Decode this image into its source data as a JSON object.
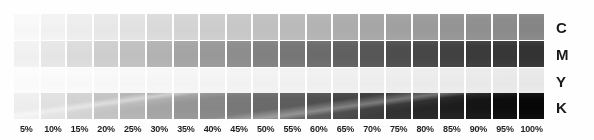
{
  "chart_data": {
    "type": "heatmap",
    "xlabel": "",
    "ylabel": "",
    "grid": false,
    "legend_position": "right",
    "categories": [
      "5%",
      "10%",
      "15%",
      "20%",
      "25%",
      "30%",
      "35%",
      "40%",
      "45%",
      "50%",
      "55%",
      "60%",
      "65%",
      "70%",
      "75%",
      "80%",
      "85%",
      "90%",
      "95%",
      "100%"
    ],
    "tick_values": [
      5,
      10,
      15,
      20,
      25,
      30,
      35,
      40,
      45,
      50,
      55,
      60,
      65,
      70,
      75,
      80,
      85,
      90,
      95,
      100
    ],
    "row_labels": [
      "C",
      "M",
      "Y",
      "K"
    ],
    "series": [
      {
        "name": "C",
        "label": "C",
        "values": [
          5,
          10,
          15,
          20,
          25,
          30,
          35,
          40,
          45,
          50,
          55,
          60,
          65,
          70,
          75,
          80,
          85,
          90,
          95,
          100
        ],
        "swatch_colors": [
          "#fafafa",
          "#f4f4f4",
          "#efefef",
          "#eaeaea",
          "#e4e4e4",
          "#dcdcdc",
          "#d6d6d6",
          "#cfcfcf",
          "#c9c9c9",
          "#c2c2c2",
          "#bcbcbc",
          "#b5b5b5",
          "#aeaeae",
          "#a8a8a8",
          "#a2a2a2",
          "#9c9c9c",
          "#969696",
          "#919191",
          "#8c8c8c",
          "#878787"
        ]
      },
      {
        "name": "M",
        "label": "M",
        "values": [
          5,
          10,
          15,
          20,
          25,
          30,
          35,
          40,
          45,
          50,
          55,
          60,
          65,
          70,
          75,
          80,
          85,
          90,
          95,
          100
        ],
        "swatch_colors": [
          "#f3f3f3",
          "#e8e8e8",
          "#dddddd",
          "#d0d0d0",
          "#c2c2c2",
          "#b4b4b4",
          "#a6a6a6",
          "#9a9a9a",
          "#8e8e8e",
          "#828282",
          "#777777",
          "#6c6c6c",
          "#616161",
          "#575757",
          "#4e4e4e",
          "#474747",
          "#414141",
          "#3b3b3b",
          "#373737",
          "#333333"
        ]
      },
      {
        "name": "Y",
        "label": "Y",
        "values": [
          5,
          10,
          15,
          20,
          25,
          30,
          35,
          40,
          45,
          50,
          55,
          60,
          65,
          70,
          75,
          80,
          85,
          90,
          95,
          100
        ],
        "swatch_colors": [
          "#fdfdfd",
          "#fcfcfc",
          "#fbfbfb",
          "#fafafa",
          "#f9f9f9",
          "#f8f8f8",
          "#f7f7f7",
          "#f6f6f6",
          "#f5f5f5",
          "#f4f4f4",
          "#f3f3f3",
          "#f2f2f2",
          "#f1f1f1",
          "#f0f0f0",
          "#efefef",
          "#eeeeee",
          "#ededed",
          "#ececec",
          "#ebebeb",
          "#eaeaea"
        ]
      },
      {
        "name": "K",
        "label": "K",
        "values": [
          5,
          10,
          15,
          20,
          25,
          30,
          35,
          40,
          45,
          50,
          55,
          60,
          65,
          70,
          75,
          80,
          85,
          90,
          95,
          100
        ],
        "swatch_colors": [
          "#f0f0f0",
          "#e2e2e2",
          "#d3d3d3",
          "#c4c4c4",
          "#b5b5b5",
          "#a6a6a6",
          "#979797",
          "#888888",
          "#797979",
          "#6b6b6b",
          "#5d5d5d",
          "#505050",
          "#444444",
          "#393939",
          "#2f2f2f",
          "#262626",
          "#1d1d1d",
          "#151515",
          "#0d0d0d",
          "#070707"
        ]
      }
    ]
  },
  "axis": {
    "percent_labels": [
      "5%",
      "10%",
      "15%",
      "20%",
      "25%",
      "30%",
      "35%",
      "40%",
      "45%",
      "50%",
      "55%",
      "60%",
      "65%",
      "70%",
      "75%",
      "80%",
      "85%",
      "90%",
      "95%",
      "100%"
    ]
  },
  "rows": [
    {
      "letter": "C",
      "name": "cyan"
    },
    {
      "letter": "M",
      "name": "magenta"
    },
    {
      "letter": "Y",
      "name": "yellow"
    },
    {
      "letter": "K",
      "name": "black"
    }
  ],
  "colors": {
    "background": "#ffffff",
    "label_text": "#1f1f1f",
    "row_letter_text": "#1a1a1a"
  }
}
